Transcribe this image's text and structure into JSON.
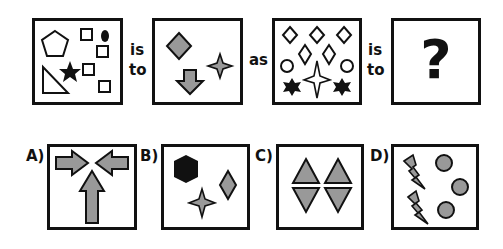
{
  "puzzle": {
    "question": {
      "connector_1": [
        "is",
        "to"
      ],
      "connector_2": "as",
      "connector_3": [
        "is",
        "to"
      ],
      "unknown_symbol": "?"
    },
    "options": [
      {
        "label": "A)",
        "description": "Three gray arrows pointing toward a central point"
      },
      {
        "label": "B)",
        "description": "Black hexagon, gray diamond, gray four-point star"
      },
      {
        "label": "C)",
        "description": "Two gray upward triangles above two gray downward triangles"
      },
      {
        "label": "D)",
        "description": "Two gray lightning bolts and three gray circles"
      }
    ],
    "colors": {
      "outline": "#111111",
      "gray_fill": "#999999",
      "black_fill": "#111111",
      "background": "#ffffff"
    }
  }
}
